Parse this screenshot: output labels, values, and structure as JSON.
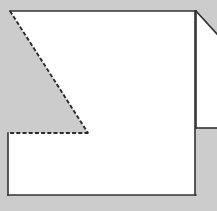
{
  "figure": {
    "width": 217,
    "height": 211,
    "background_color": "#cccccc",
    "fill_color": "#ffffff",
    "stroke_color": "#333333",
    "stroke_width": 1.6,
    "dash_pattern": "4 2.2"
  },
  "shapes": {
    "main_polygon": {
      "name": "main-polygon",
      "description": "White polygon occupying most of the frame, with its upper-left corner cut away along a dashed diagonal",
      "points": "10,11 195,11 195,195 8,195 8,133 88,133",
      "fill": "#ffffff"
    },
    "right_polygon": {
      "name": "right-edge-polygon",
      "description": "Partial white polygon clipped by the right frame edge, bounded above by a diagonal",
      "points": "196,11 217,34 217,128 196,128",
      "fill": "#ffffff"
    }
  },
  "solid_edges": [
    {
      "name": "top-edge",
      "x1": 10,
      "y1": 11,
      "x2": 195,
      "y2": 11
    },
    {
      "name": "right-edge",
      "x1": 195,
      "y1": 11,
      "x2": 195,
      "y2": 195
    },
    {
      "name": "bottom-edge",
      "x1": 195,
      "y1": 195,
      "x2": 8,
      "y2": 195
    },
    {
      "name": "left-edge",
      "x1": 8,
      "y1": 195,
      "x2": 8,
      "y2": 133
    },
    {
      "name": "right-shape-diagonal-edge",
      "x1": 196,
      "y1": 11,
      "x2": 217,
      "y2": 34
    },
    {
      "name": "right-shape-vertical-edge",
      "x1": 196,
      "y1": 11,
      "x2": 196,
      "y2": 128
    },
    {
      "name": "right-shape-horizontal-edge",
      "x1": 196,
      "y1": 128,
      "x2": 217,
      "y2": 128
    }
  ],
  "dashed_edges": [
    {
      "name": "fold-line-diagonal",
      "x1": 10,
      "y1": 11,
      "x2": 88,
      "y2": 133
    },
    {
      "name": "fold-line-horizontal",
      "x1": 88,
      "y1": 133,
      "x2": 8,
      "y2": 133
    }
  ],
  "vertices": [
    {
      "name": "vertex-top-left",
      "x": 10,
      "y": 11
    },
    {
      "name": "vertex-top-right",
      "x": 195,
      "y": 11
    },
    {
      "name": "vertex-bottom-right",
      "x": 195,
      "y": 195
    },
    {
      "name": "vertex-bottom-left",
      "x": 8,
      "y": 195
    },
    {
      "name": "vertex-notch-left",
      "x": 8,
      "y": 133
    },
    {
      "name": "vertex-notch-apex",
      "x": 88,
      "y": 133
    }
  ]
}
